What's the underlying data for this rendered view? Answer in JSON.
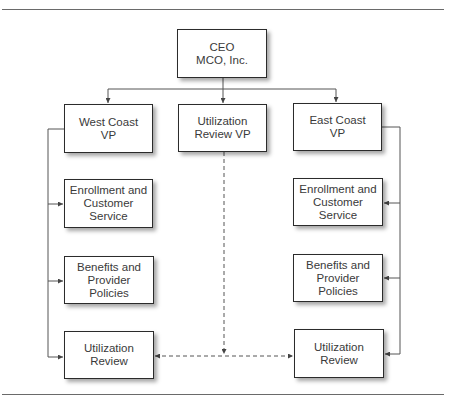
{
  "diagram": {
    "type": "org-chart",
    "colors": {
      "box_border": "#2b2b2b",
      "line": "#555555",
      "text": "#3a3a3a",
      "rule": "#6a6a6a"
    },
    "nodes": {
      "ceo": "CEO\nMCO, Inc.",
      "west_vp": "West Coast\nVP",
      "util_vp": "Utilization\nReview VP",
      "east_vp": "East Coast\nVP",
      "west_enrollment": "Enrollment and\nCustomer\nService",
      "west_benefits": "Benefits and\nProvider\nPolicies",
      "west_util": "Utilization\nReview",
      "east_enrollment": "Enrollment and\nCustomer\nService",
      "east_benefits": "Benefits and\nProvider\nPolicies",
      "east_util": "Utilization\nReview"
    },
    "edges": [
      {
        "from": "CEO MCO, Inc.",
        "to": "West Coast VP",
        "style": "solid"
      },
      {
        "from": "CEO MCO, Inc.",
        "to": "Utilization Review VP",
        "style": "solid"
      },
      {
        "from": "CEO MCO, Inc.",
        "to": "East Coast VP",
        "style": "solid"
      },
      {
        "from": "West Coast VP",
        "to": "Enrollment and Customer Service (West)",
        "style": "solid"
      },
      {
        "from": "West Coast VP",
        "to": "Benefits and Provider Policies (West)",
        "style": "solid"
      },
      {
        "from": "West Coast VP",
        "to": "Utilization Review (West)",
        "style": "solid"
      },
      {
        "from": "East Coast VP",
        "to": "Enrollment and Customer Service (East)",
        "style": "solid"
      },
      {
        "from": "East Coast VP",
        "to": "Benefits and Provider Policies (East)",
        "style": "solid"
      },
      {
        "from": "East Coast VP",
        "to": "Utilization Review (East)",
        "style": "solid"
      },
      {
        "from": "Utilization Review VP",
        "to": "Utilization Review (West)",
        "style": "dashed"
      },
      {
        "from": "Utilization Review VP",
        "to": "Utilization Review (East)",
        "style": "dashed"
      }
    ]
  }
}
